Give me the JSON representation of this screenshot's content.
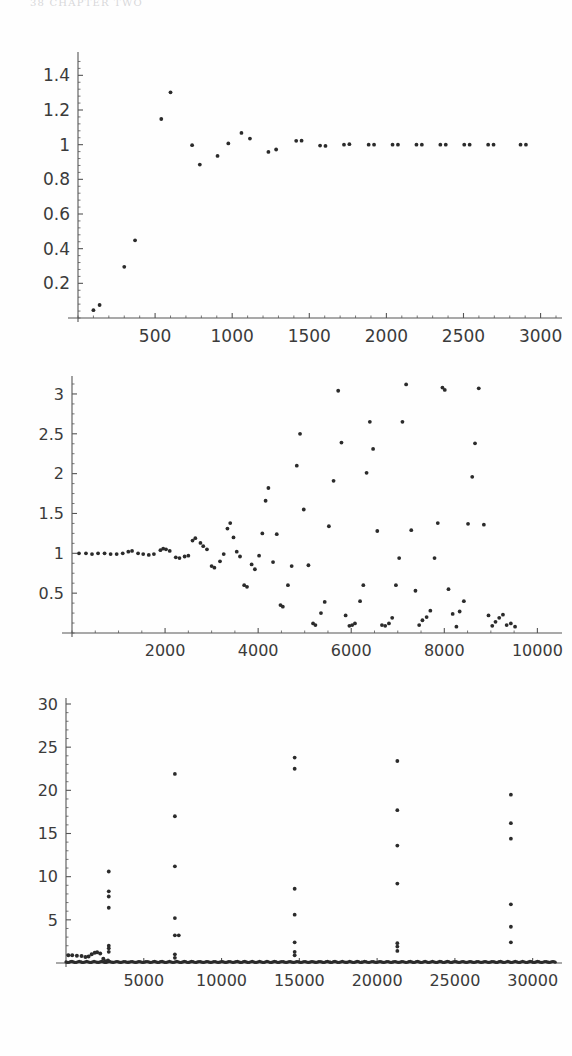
{
  "page": {
    "running_head": "38        CHAPTER  TWO",
    "background": "#fefefe",
    "ink_color": "#2b2b2b",
    "axis_color": "#555555",
    "width": 572,
    "height": 1056
  },
  "chart_data": [
    {
      "id": "plot-top",
      "type": "scatter",
      "title": "",
      "xlabel": "",
      "ylabel": "",
      "xlim": [
        0,
        3100
      ],
      "ylim": [
        0,
        1.5
      ],
      "xticks": [
        500,
        1000,
        1500,
        2000,
        2500,
        3000
      ],
      "xtick_labels": [
        "500",
        "1000",
        "1500",
        "2000",
        "2500",
        "3000"
      ],
      "yticks": [
        0.2,
        0.4,
        0.6,
        0.8,
        1,
        1.2,
        1.4
      ],
      "ytick_labels": [
        "0.2",
        "0.4",
        "0.6",
        "0.8",
        "1",
        "1.2",
        "1.4"
      ],
      "grid": false,
      "legend": "none",
      "marker": "dot",
      "points": [
        [
          100,
          0.045
        ],
        [
          140,
          0.075
        ],
        [
          300,
          0.295
        ],
        [
          370,
          0.448
        ],
        [
          540,
          1.148
        ],
        [
          600,
          1.302
        ],
        [
          740,
          0.997
        ],
        [
          790,
          0.885
        ],
        [
          905,
          0.935
        ],
        [
          975,
          1.007
        ],
        [
          1060,
          1.068
        ],
        [
          1115,
          1.035
        ],
        [
          1235,
          0.958
        ],
        [
          1285,
          0.972
        ],
        [
          1415,
          1.022
        ],
        [
          1450,
          1.023
        ],
        [
          1570,
          0.995
        ],
        [
          1605,
          0.993
        ],
        [
          1725,
          1.0
        ],
        [
          1760,
          1.003
        ],
        [
          1885,
          1.0
        ],
        [
          1920,
          1.0
        ],
        [
          2040,
          1.0
        ],
        [
          2075,
          1.0
        ],
        [
          2195,
          1.0
        ],
        [
          2230,
          1.0
        ],
        [
          2350,
          1.0
        ],
        [
          2385,
          1.0
        ],
        [
          2505,
          1.0
        ],
        [
          2540,
          1.0
        ],
        [
          2660,
          1.0
        ],
        [
          2695,
          1.0
        ],
        [
          2870,
          1.0
        ],
        [
          2905,
          1.0
        ]
      ]
    },
    {
      "id": "plot-middle",
      "type": "scatter",
      "title": "",
      "xlabel": "",
      "ylabel": "",
      "xlim": [
        0,
        10400
      ],
      "ylim": [
        0,
        3.15
      ],
      "xticks": [
        2000,
        4000,
        6000,
        8000,
        10000
      ],
      "xtick_labels": [
        "2000",
        "4000",
        "6000",
        "8000",
        "10000"
      ],
      "yticks": [
        0.5,
        1,
        1.5,
        2,
        2.5,
        3
      ],
      "ytick_labels": [
        "0.5",
        "1",
        "1.5",
        "2",
        "2.5",
        "3"
      ],
      "grid": false,
      "legend": "none",
      "marker": "dot",
      "points": [
        [
          150,
          1.0
        ],
        [
          300,
          1.0
        ],
        [
          430,
          0.99
        ],
        [
          560,
          1.0
        ],
        [
          700,
          1.0
        ],
        [
          830,
          0.99
        ],
        [
          960,
          0.99
        ],
        [
          1090,
          1.0
        ],
        [
          1210,
          1.02
        ],
        [
          1290,
          1.03
        ],
        [
          1420,
          1.0
        ],
        [
          1530,
          0.99
        ],
        [
          1650,
          0.98
        ],
        [
          1760,
          0.99
        ],
        [
          1900,
          1.04
        ],
        [
          1960,
          1.06
        ],
        [
          2020,
          1.05
        ],
        [
          2100,
          1.03
        ],
        [
          2230,
          0.95
        ],
        [
          2310,
          0.94
        ],
        [
          2420,
          0.96
        ],
        [
          2500,
          0.97
        ],
        [
          2590,
          1.16
        ],
        [
          2650,
          1.19
        ],
        [
          2760,
          1.13
        ],
        [
          2820,
          1.09
        ],
        [
          2900,
          1.05
        ],
        [
          3000,
          0.84
        ],
        [
          3060,
          0.82
        ],
        [
          3180,
          0.9
        ],
        [
          3260,
          0.99
        ],
        [
          3340,
          1.31
        ],
        [
          3400,
          1.38
        ],
        [
          3470,
          1.2
        ],
        [
          3540,
          1.02
        ],
        [
          3610,
          0.96
        ],
        [
          3700,
          0.6
        ],
        [
          3760,
          0.58
        ],
        [
          3860,
          0.86
        ],
        [
          3930,
          0.8
        ],
        [
          4020,
          0.97
        ],
        [
          4090,
          1.25
        ],
        [
          4160,
          1.66
        ],
        [
          4220,
          1.82
        ],
        [
          4320,
          0.89
        ],
        [
          4400,
          1.24
        ],
        [
          4480,
          0.35
        ],
        [
          4530,
          0.33
        ],
        [
          4640,
          0.6
        ],
        [
          4720,
          0.84
        ],
        [
          4830,
          2.1
        ],
        [
          4900,
          2.5
        ],
        [
          4980,
          1.55
        ],
        [
          5080,
          0.85
        ],
        [
          5180,
          0.12
        ],
        [
          5230,
          0.1
        ],
        [
          5350,
          0.25
        ],
        [
          5430,
          0.39
        ],
        [
          5520,
          1.34
        ],
        [
          5620,
          1.91
        ],
        [
          5720,
          3.04
        ],
        [
          5790,
          2.39
        ],
        [
          5880,
          0.22
        ],
        [
          5960,
          0.09
        ],
        [
          6020,
          0.1
        ],
        [
          6080,
          0.12
        ],
        [
          6190,
          0.4
        ],
        [
          6260,
          0.6
        ],
        [
          6330,
          2.01
        ],
        [
          6400,
          2.65
        ],
        [
          6470,
          2.31
        ],
        [
          6560,
          1.28
        ],
        [
          6660,
          0.1
        ],
        [
          6730,
          0.09
        ],
        [
          6810,
          0.12
        ],
        [
          6880,
          0.19
        ],
        [
          6960,
          0.6
        ],
        [
          7030,
          0.94
        ],
        [
          7100,
          2.65
        ],
        [
          7180,
          3.12
        ],
        [
          7290,
          1.29
        ],
        [
          7380,
          0.53
        ],
        [
          7460,
          0.1
        ],
        [
          7530,
          0.16
        ],
        [
          7620,
          0.2
        ],
        [
          7700,
          0.28
        ],
        [
          7790,
          0.94
        ],
        [
          7860,
          1.38
        ],
        [
          7960,
          3.08
        ],
        [
          8010,
          3.05
        ],
        [
          8090,
          0.55
        ],
        [
          8180,
          0.24
        ],
        [
          8260,
          0.08
        ],
        [
          8330,
          0.27
        ],
        [
          8420,
          0.4
        ],
        [
          8510,
          1.37
        ],
        [
          8600,
          1.96
        ],
        [
          8660,
          2.38
        ],
        [
          8740,
          3.07
        ],
        [
          8850,
          1.36
        ],
        [
          8950,
          0.22
        ],
        [
          9030,
          0.09
        ],
        [
          9100,
          0.14
        ],
        [
          9180,
          0.19
        ],
        [
          9260,
          0.23
        ],
        [
          9340,
          0.1
        ],
        [
          9430,
          0.12
        ],
        [
          9520,
          0.08
        ]
      ]
    },
    {
      "id": "plot-bottom",
      "type": "scatter",
      "title": "",
      "xlabel": "",
      "ylabel": "",
      "xlim": [
        0,
        31500
      ],
      "ylim": [
        0,
        30
      ],
      "xticks": [
        5000,
        10000,
        15000,
        20000,
        25000,
        30000
      ],
      "xtick_labels": [
        "5000",
        "10000",
        "15000",
        "20000",
        "25000",
        "30000"
      ],
      "yticks": [
        5,
        10,
        15,
        20,
        25,
        30
      ],
      "ytick_labels": [
        "5",
        "10",
        "15",
        "20",
        "25",
        "30"
      ],
      "grid": false,
      "legend": "none",
      "marker": "dot",
      "baseline_note": "dense near-zero band across entire x-range",
      "spikes": [
        {
          "x": 2750,
          "values": [
            1.3,
            1.7,
            2.0,
            6.4,
            7.7,
            8.3,
            10.6
          ]
        },
        {
          "x": 7000,
          "values": [
            0.6,
            1.0,
            3.2,
            5.2,
            11.2,
            17.0,
            21.9
          ]
        },
        {
          "x": 7250,
          "values": [
            3.2
          ]
        },
        {
          "x": 14700,
          "values": [
            0.9,
            1.3,
            2.4,
            5.6,
            8.6,
            22.5,
            23.8
          ]
        },
        {
          "x": 21300,
          "values": [
            1.4,
            1.9,
            2.3,
            9.2,
            13.6,
            17.7,
            23.4
          ]
        },
        {
          "x": 28600,
          "values": [
            2.4,
            4.2,
            6.8,
            14.4,
            16.2,
            19.5
          ]
        }
      ],
      "early_band": [
        [
          150,
          0.9
        ],
        [
          400,
          0.9
        ],
        [
          700,
          0.85
        ],
        [
          1000,
          0.8
        ],
        [
          1250,
          0.7
        ],
        [
          1450,
          0.75
        ],
        [
          1650,
          1.0
        ],
        [
          1850,
          1.2
        ],
        [
          2000,
          1.25
        ],
        [
          2200,
          1.1
        ],
        [
          2400,
          0.5
        ],
        [
          2550,
          0.2
        ],
        [
          2700,
          0.3
        ]
      ]
    }
  ]
}
